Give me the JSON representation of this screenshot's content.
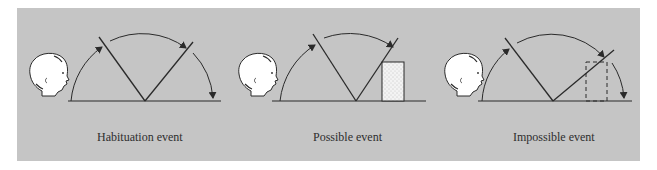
{
  "figure": {
    "background_color": "#c5c5c5",
    "line_color": "#2a2a2a",
    "panels": [
      {
        "id": "habituation",
        "label": "Habituation event"
      },
      {
        "id": "possible",
        "label": "Possible event"
      },
      {
        "id": "impossible",
        "label": "Impossible event"
      }
    ]
  }
}
